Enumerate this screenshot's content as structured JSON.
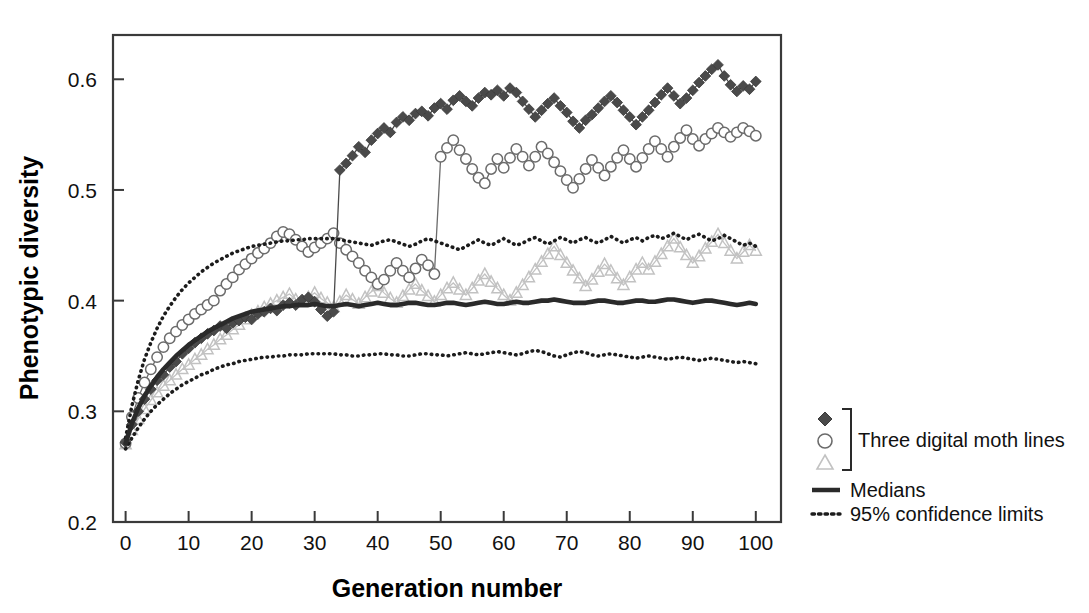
{
  "chart_data": {
    "type": "line",
    "title": "",
    "xlabel": "Generation number",
    "ylabel": "Phenotypic diversity",
    "xlim": [
      -2,
      104
    ],
    "ylim": [
      0.2,
      0.64
    ],
    "xticks": [
      0,
      10,
      20,
      30,
      40,
      50,
      60,
      70,
      80,
      90,
      100
    ],
    "yticks": [
      0.2,
      0.3,
      0.4,
      0.5,
      0.6
    ],
    "xticklabels": [
      "0",
      "10",
      "20",
      "30",
      "40",
      "50",
      "60",
      "70",
      "80",
      "90",
      "100"
    ],
    "yticklabels": [
      "0.2",
      "0.3",
      "0.4",
      "0.5",
      "0.6"
    ],
    "grid": false,
    "legend_position": "right-outside",
    "x": [
      0,
      1,
      2,
      3,
      4,
      5,
      6,
      7,
      8,
      9,
      10,
      11,
      12,
      13,
      14,
      15,
      16,
      17,
      18,
      19,
      20,
      21,
      22,
      23,
      24,
      25,
      26,
      27,
      28,
      29,
      30,
      31,
      32,
      33,
      34,
      35,
      36,
      37,
      38,
      39,
      40,
      41,
      42,
      43,
      44,
      45,
      46,
      47,
      48,
      49,
      50,
      51,
      52,
      53,
      54,
      55,
      56,
      57,
      58,
      59,
      60,
      61,
      62,
      63,
      64,
      65,
      66,
      67,
      68,
      69,
      70,
      71,
      72,
      73,
      74,
      75,
      76,
      77,
      78,
      79,
      80,
      81,
      82,
      83,
      84,
      85,
      86,
      87,
      88,
      89,
      90,
      91,
      92,
      93,
      94,
      95,
      96,
      97,
      98,
      99,
      100
    ],
    "series": [
      {
        "name": "Digital moth line 1",
        "marker": "filled-diamond",
        "color": "#4a4a4a",
        "values": [
          0.272,
          0.288,
          0.3,
          0.311,
          0.32,
          0.328,
          0.333,
          0.34,
          0.345,
          0.352,
          0.357,
          0.362,
          0.366,
          0.37,
          0.373,
          0.377,
          0.375,
          0.38,
          0.382,
          0.385,
          0.383,
          0.388,
          0.39,
          0.393,
          0.391,
          0.396,
          0.398,
          0.396,
          0.401,
          0.403,
          0.399,
          0.392,
          0.386,
          0.39,
          0.518,
          0.524,
          0.531,
          0.539,
          0.534,
          0.545,
          0.551,
          0.556,
          0.552,
          0.561,
          0.566,
          0.563,
          0.569,
          0.571,
          0.567,
          0.574,
          0.578,
          0.573,
          0.581,
          0.585,
          0.58,
          0.576,
          0.583,
          0.588,
          0.586,
          0.59,
          0.585,
          0.592,
          0.588,
          0.58,
          0.573,
          0.566,
          0.572,
          0.578,
          0.583,
          0.576,
          0.57,
          0.562,
          0.556,
          0.563,
          0.568,
          0.574,
          0.58,
          0.585,
          0.579,
          0.572,
          0.566,
          0.559,
          0.566,
          0.572,
          0.579,
          0.586,
          0.592,
          0.585,
          0.578,
          0.583,
          0.59,
          0.597,
          0.603,
          0.609,
          0.613,
          0.603,
          0.595,
          0.589,
          0.594,
          0.591,
          0.598
        ]
      },
      {
        "name": "Digital moth line 2",
        "marker": "open-circle",
        "color": "#6b6b6b",
        "values": [
          0.271,
          0.295,
          0.312,
          0.326,
          0.338,
          0.349,
          0.358,
          0.366,
          0.372,
          0.378,
          0.383,
          0.388,
          0.392,
          0.396,
          0.4,
          0.409,
          0.415,
          0.421,
          0.428,
          0.433,
          0.438,
          0.443,
          0.447,
          0.452,
          0.458,
          0.462,
          0.46,
          0.455,
          0.449,
          0.444,
          0.448,
          0.452,
          0.456,
          0.461,
          0.452,
          0.446,
          0.44,
          0.434,
          0.427,
          0.421,
          0.415,
          0.419,
          0.427,
          0.434,
          0.427,
          0.421,
          0.429,
          0.437,
          0.432,
          0.424,
          0.53,
          0.538,
          0.545,
          0.536,
          0.528,
          0.519,
          0.511,
          0.506,
          0.519,
          0.528,
          0.52,
          0.529,
          0.537,
          0.53,
          0.522,
          0.53,
          0.539,
          0.533,
          0.525,
          0.517,
          0.509,
          0.502,
          0.51,
          0.519,
          0.527,
          0.52,
          0.513,
          0.521,
          0.529,
          0.536,
          0.528,
          0.521,
          0.529,
          0.537,
          0.544,
          0.537,
          0.53,
          0.539,
          0.547,
          0.554,
          0.546,
          0.54,
          0.546,
          0.551,
          0.556,
          0.552,
          0.548,
          0.552,
          0.556,
          0.553,
          0.549
        ]
      },
      {
        "name": "Digital moth line 3",
        "marker": "open-triangle",
        "color": "#c2c2c2",
        "values": [
          0.27,
          0.283,
          0.293,
          0.302,
          0.31,
          0.317,
          0.323,
          0.328,
          0.333,
          0.338,
          0.342,
          0.347,
          0.351,
          0.356,
          0.36,
          0.365,
          0.369,
          0.374,
          0.378,
          0.383,
          0.387,
          0.39,
          0.394,
          0.397,
          0.4,
          0.403,
          0.406,
          0.401,
          0.398,
          0.403,
          0.407,
          0.402,
          0.398,
          0.394,
          0.399,
          0.405,
          0.401,
          0.397,
          0.403,
          0.408,
          0.413,
          0.407,
          0.402,
          0.398,
          0.404,
          0.41,
          0.415,
          0.409,
          0.404,
          0.399,
          0.405,
          0.411,
          0.416,
          0.41,
          0.405,
          0.411,
          0.418,
          0.424,
          0.417,
          0.411,
          0.405,
          0.4,
          0.407,
          0.414,
          0.421,
          0.428,
          0.435,
          0.442,
          0.449,
          0.441,
          0.434,
          0.427,
          0.42,
          0.413,
          0.419,
          0.426,
          0.433,
          0.427,
          0.42,
          0.414,
          0.421,
          0.428,
          0.434,
          0.428,
          0.435,
          0.442,
          0.449,
          0.456,
          0.448,
          0.441,
          0.434,
          0.44,
          0.447,
          0.453,
          0.46,
          0.452,
          0.445,
          0.438,
          0.444,
          0.45,
          0.445
        ]
      },
      {
        "name": "Medians",
        "marker": "none",
        "line": "solid-thick",
        "color": "#2a2a2a",
        "values": [
          0.271,
          0.289,
          0.303,
          0.314,
          0.323,
          0.331,
          0.338,
          0.344,
          0.35,
          0.355,
          0.36,
          0.364,
          0.368,
          0.372,
          0.375,
          0.378,
          0.381,
          0.384,
          0.386,
          0.388,
          0.39,
          0.391,
          0.392,
          0.393,
          0.394,
          0.395,
          0.395,
          0.396,
          0.396,
          0.396,
          0.397,
          0.396,
          0.395,
          0.395,
          0.396,
          0.397,
          0.396,
          0.395,
          0.396,
          0.397,
          0.398,
          0.397,
          0.396,
          0.396,
          0.397,
          0.398,
          0.398,
          0.397,
          0.396,
          0.396,
          0.397,
          0.398,
          0.398,
          0.397,
          0.396,
          0.397,
          0.398,
          0.399,
          0.398,
          0.397,
          0.397,
          0.398,
          0.399,
          0.398,
          0.398,
          0.399,
          0.4,
          0.4,
          0.401,
          0.4,
          0.399,
          0.398,
          0.398,
          0.398,
          0.399,
          0.4,
          0.4,
          0.399,
          0.398,
          0.398,
          0.399,
          0.4,
          0.4,
          0.399,
          0.399,
          0.4,
          0.401,
          0.401,
          0.4,
          0.399,
          0.398,
          0.399,
          0.4,
          0.4,
          0.399,
          0.398,
          0.397,
          0.396,
          0.397,
          0.398,
          0.397
        ]
      },
      {
        "name": "95% confidence limit (upper)",
        "marker": "none",
        "line": "dotted",
        "color": "#1c1c1c",
        "values": [
          0.276,
          0.305,
          0.328,
          0.347,
          0.362,
          0.375,
          0.386,
          0.395,
          0.403,
          0.41,
          0.416,
          0.421,
          0.426,
          0.43,
          0.434,
          0.437,
          0.44,
          0.443,
          0.445,
          0.447,
          0.449,
          0.45,
          0.451,
          0.452,
          0.453,
          0.454,
          0.454,
          0.455,
          0.455,
          0.456,
          0.456,
          0.456,
          0.456,
          0.456,
          0.455,
          0.454,
          0.453,
          0.452,
          0.451,
          0.45,
          0.452,
          0.454,
          0.455,
          0.453,
          0.451,
          0.449,
          0.451,
          0.454,
          0.456,
          0.454,
          0.452,
          0.45,
          0.448,
          0.446,
          0.449,
          0.452,
          0.455,
          0.452,
          0.45,
          0.453,
          0.456,
          0.453,
          0.45,
          0.452,
          0.455,
          0.457,
          0.454,
          0.451,
          0.454,
          0.457,
          0.455,
          0.452,
          0.455,
          0.457,
          0.454,
          0.452,
          0.455,
          0.458,
          0.455,
          0.452,
          0.455,
          0.457,
          0.454,
          0.457,
          0.459,
          0.456,
          0.458,
          0.461,
          0.458,
          0.455,
          0.458,
          0.46,
          0.457,
          0.454,
          0.456,
          0.459,
          0.456,
          0.453,
          0.45,
          0.452,
          0.449
        ]
      },
      {
        "name": "95% confidence limit (lower)",
        "marker": "none",
        "line": "dotted",
        "color": "#1c1c1c",
        "values": [
          0.266,
          0.276,
          0.285,
          0.293,
          0.3,
          0.306,
          0.311,
          0.316,
          0.32,
          0.324,
          0.327,
          0.33,
          0.333,
          0.335,
          0.338,
          0.34,
          0.342,
          0.343,
          0.345,
          0.346,
          0.347,
          0.348,
          0.349,
          0.349,
          0.35,
          0.35,
          0.351,
          0.351,
          0.351,
          0.352,
          0.352,
          0.352,
          0.352,
          0.352,
          0.351,
          0.351,
          0.35,
          0.35,
          0.351,
          0.351,
          0.352,
          0.352,
          0.351,
          0.351,
          0.35,
          0.35,
          0.351,
          0.352,
          0.352,
          0.351,
          0.351,
          0.35,
          0.351,
          0.352,
          0.353,
          0.352,
          0.351,
          0.352,
          0.353,
          0.354,
          0.353,
          0.352,
          0.351,
          0.352,
          0.354,
          0.355,
          0.354,
          0.352,
          0.35,
          0.349,
          0.351,
          0.353,
          0.354,
          0.353,
          0.351,
          0.35,
          0.351,
          0.352,
          0.351,
          0.35,
          0.349,
          0.348,
          0.349,
          0.35,
          0.349,
          0.348,
          0.347,
          0.348,
          0.349,
          0.348,
          0.347,
          0.346,
          0.347,
          0.348,
          0.347,
          0.346,
          0.345,
          0.344,
          0.345,
          0.344,
          0.343
        ]
      }
    ]
  },
  "legend": {
    "group_label": "Three digital moth lines",
    "medians_label": "Medians",
    "confidence_label": "95% confidence limits"
  }
}
